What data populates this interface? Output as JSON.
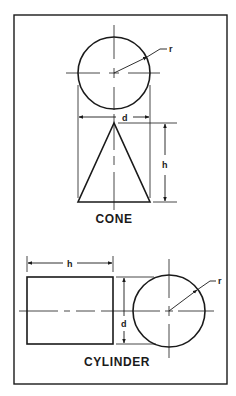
{
  "figure": {
    "colors": {
      "stroke": "#1a1a1a",
      "background": "#ffffff"
    },
    "cone": {
      "title": "CONE",
      "radius_label": "r",
      "diameter_label": "d",
      "height_label": "h"
    },
    "cylinder": {
      "title": "CYLINDER",
      "radius_label": "r",
      "diameter_label": "d",
      "height_label": "h"
    }
  }
}
